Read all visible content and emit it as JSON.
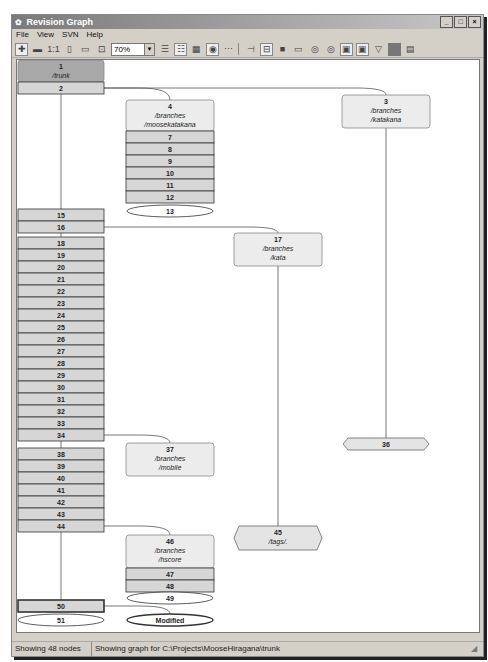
{
  "window": {
    "title": "Revision Graph",
    "controls": [
      "minimize",
      "maximize",
      "close"
    ]
  },
  "menu": {
    "items": [
      {
        "label": "File",
        "accel": "F"
      },
      {
        "label": "View",
        "accel": "V"
      },
      {
        "label": "SVN",
        "accel": "S"
      },
      {
        "label": "Help",
        "accel": "H"
      }
    ]
  },
  "toolbar": {
    "zoom_value": "70%",
    "buttons": [
      "zoom-in-icon",
      "zoom-out-icon",
      "zoom-100-icon",
      "zoom-height-icon",
      "zoom-width-icon",
      "zoom-fit-icon",
      "group-branches-icon",
      "oldest-on-top-icon",
      "align-trees-icon",
      "show-head-icon",
      "more-icon",
      "exact-copy-source-icon",
      "fold-tags-icon",
      "reduce-cross-lines-icon",
      "remove-deleted-icon",
      "show-wc-rev-icon",
      "show-wc-mods-icon",
      "show-diff-paths-icon",
      "show-tree-stripes-icon",
      "filter-icon",
      "color-icon",
      "legend-icon"
    ]
  },
  "graph": {
    "trunk": {
      "head": {
        "rev": "1",
        "path": "/trunk"
      },
      "revisions": [
        "2",
        "15",
        "16",
        "18",
        "19",
        "20",
        "21",
        "22",
        "23",
        "24",
        "25",
        "26",
        "27",
        "28",
        "29",
        "30",
        "31",
        "32",
        "33",
        "34",
        "38",
        "39",
        "40",
        "41",
        "42",
        "43",
        "44",
        "50"
      ],
      "wc_rev": "51",
      "wc_mod": "Modified"
    },
    "branches": [
      {
        "rev": "4",
        "path1": "/branches",
        "path2": "/moosekatakana",
        "revisions": [
          "7",
          "8",
          "9",
          "10",
          "11",
          "12"
        ],
        "tail": "13"
      },
      {
        "rev": "3",
        "path1": "/branches",
        "path2": "/katakana",
        "revisions": [],
        "tail": "36"
      },
      {
        "rev": "17",
        "path1": "/branches",
        "path2": "/kata",
        "revisions": [],
        "tail": "45",
        "tail_path": "/tags/."
      },
      {
        "rev": "37",
        "path1": "/branches",
        "path2": "/mobile",
        "revisions": []
      },
      {
        "rev": "46",
        "path1": "/branches",
        "path2": "/hscore",
        "revisions": [
          "47",
          "48"
        ],
        "tail": "49"
      }
    ]
  },
  "status": {
    "nodes": "Showing 48 nodes",
    "path": "Showing graph for C:\\Projects\\MooseHiragana\\trunk"
  },
  "colors": {
    "trunk_head": "#a8a8a8",
    "node_fill": "#d6d6d6",
    "branch_head": "#ececec",
    "tag_fill": "#e4e4e4",
    "border": "#333333"
  }
}
